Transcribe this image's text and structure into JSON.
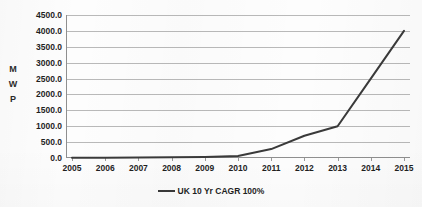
{
  "chart_data": {
    "type": "line",
    "title": "",
    "xlabel": "",
    "ylabel": "MWp",
    "ylabel_letters": [
      "M",
      "W",
      "P"
    ],
    "categories": [
      "2005",
      "2006",
      "2007",
      "2008",
      "2009",
      "2010",
      "2011",
      "2012",
      "2013",
      "2014",
      "2015"
    ],
    "ytick_labels": [
      "0.0",
      "500.0",
      "1000.0",
      "1500.0",
      "2000.0",
      "2500.0",
      "3000.0",
      "3500.0",
      "4000.0",
      "4500.0"
    ],
    "ylim": [
      0,
      4500
    ],
    "ytick_step": 500,
    "grid": true,
    "legend_position": "bottom",
    "series": [
      {
        "name": "UK 10 Yr CAGR 100%",
        "color": "#3a3a3a",
        "values": [
          5,
          8,
          14,
          22,
          35,
          60,
          280,
          700,
          1000,
          2500,
          4000
        ]
      }
    ]
  },
  "legend": {
    "entries": [
      {
        "label": "UK 10 Yr CAGR 100%",
        "color": "#3a3a3a",
        "marker": "line-swatch"
      }
    ]
  },
  "colors": {
    "gridline": "#b9b9b9",
    "axis": "#8f8f8f",
    "series": "#3a3a3a",
    "text": "#1f1f1f",
    "background": "#fdfdfd"
  }
}
